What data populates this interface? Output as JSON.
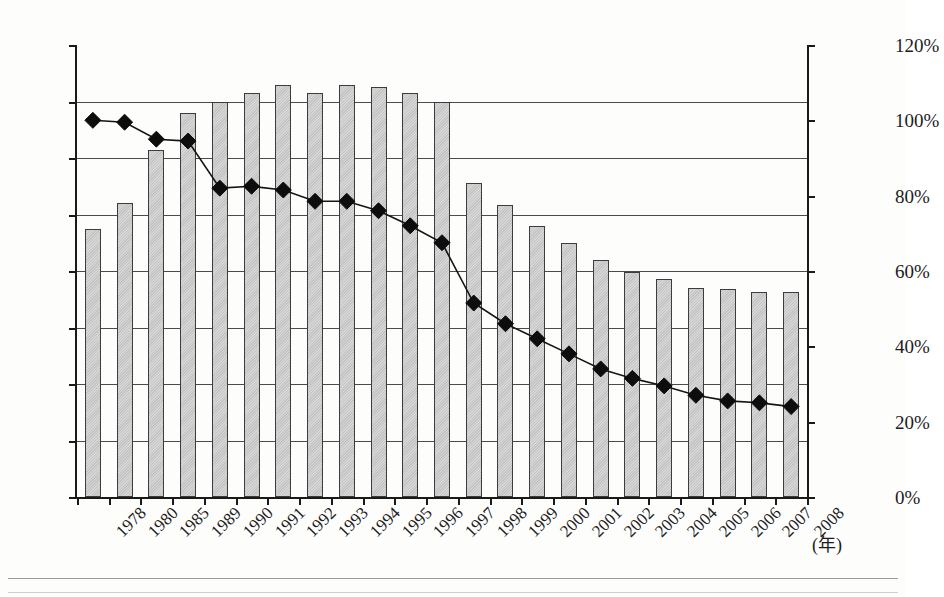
{
  "chart_data": {
    "type": "bar",
    "title": "",
    "subtitle": "",
    "xlabel": "(年)",
    "ylabel": "",
    "ylabel_right": "",
    "ylim": [
      0,
      160
    ],
    "ylim_right": [
      0,
      120
    ],
    "ytick_step": 20,
    "grid": true,
    "legend": "none",
    "categories": [
      "1978",
      "1980",
      "1985",
      "1989",
      "1990",
      "1991",
      "1992",
      "1993",
      "1994",
      "1995",
      "1996",
      "1997",
      "1998",
      "1999",
      "2000",
      "2001",
      "2002",
      "2003",
      "2004",
      "2005",
      "2006",
      "2007",
      "2008"
    ],
    "yticks_left": [
      "0",
      "20",
      "40",
      "60",
      "80",
      "100",
      "120",
      "140",
      "160"
    ],
    "yticks_right": [
      "0%",
      "20%",
      "40%",
      "60%",
      "80%",
      "100%",
      "120%"
    ],
    "series": [
      {
        "name": "bars",
        "type": "bar",
        "axis": "left",
        "values": [
          95,
          104,
          123,
          136,
          140,
          143,
          146,
          143,
          146,
          145,
          143,
          140,
          111,
          103.5,
          96,
          90,
          84,
          79.5,
          77,
          74,
          73.5,
          72.5,
          72.5
        ]
      },
      {
        "name": "line",
        "type": "line",
        "axis": "right",
        "marker": "diamond",
        "values_percent": [
          100,
          99.5,
          95,
          94.5,
          82,
          82.5,
          81.5,
          78.5,
          78.5,
          76,
          72,
          67.5,
          51.5,
          46,
          42,
          38,
          34,
          31.5,
          29.5,
          27,
          25.5,
          25,
          24
        ]
      }
    ]
  },
  "axis": {
    "x_unit_label": "(年)"
  }
}
